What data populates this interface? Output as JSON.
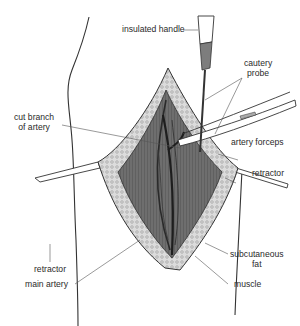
{
  "diagram": {
    "style": "grayscale line illustration",
    "colors": {
      "background": "#ffffff",
      "line": "#333333",
      "label_text": "#2a2a2a",
      "tissue_dark": "#555555",
      "tissue_mid": "#8a8a8a",
      "fat_light": "#d8d8d8"
    }
  },
  "labels": {
    "insulated_handle": "insulated handle",
    "cautery_probe_line1": "cautery",
    "cautery_probe_line2": "probe",
    "cut_branch_line1": "cut branch",
    "cut_branch_line2": "of artery",
    "artery_forceps": "artery forceps",
    "retractor_right": "retractor",
    "retractor_left": "retractor",
    "subcutaneous_fat_line1": "subcutaneous",
    "subcutaneous_fat_line2": "fat",
    "main_artery": "main artery",
    "muscle": "muscle"
  }
}
